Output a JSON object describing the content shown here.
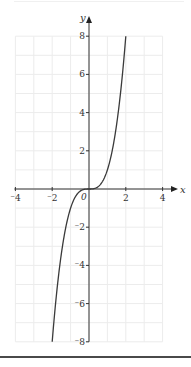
{
  "chart_data": {
    "type": "line",
    "title": "",
    "xlabel": "x",
    "ylabel": "y",
    "xlim": [
      -4,
      4
    ],
    "ylim": [
      -8,
      8
    ],
    "grid": true,
    "legend": null,
    "x_ticks": [
      -4,
      -2,
      0,
      2,
      4
    ],
    "x_tick_labels": [
      "⁻4",
      "⁻2",
      "0",
      "2",
      "4"
    ],
    "y_ticks": [
      -8,
      -6,
      -4,
      -2,
      2,
      4,
      6,
      8
    ],
    "y_tick_labels": [
      "⁻8",
      "⁻6",
      "⁻4",
      "⁻2",
      "2",
      "4",
      "6",
      "8"
    ],
    "origin_label": "0",
    "series": [
      {
        "name": "y = x^3",
        "x": [
          -2,
          -1.75,
          -1.5,
          -1.25,
          -1,
          -0.75,
          -0.5,
          -0.25,
          0,
          0.25,
          0.5,
          0.75,
          1,
          1.25,
          1.5,
          1.75,
          2
        ],
        "values": [
          -8,
          -5.36,
          -3.375,
          -1.95,
          -1,
          -0.42,
          -0.125,
          -0.016,
          0,
          0.016,
          0.125,
          0.42,
          1,
          1.95,
          3.375,
          5.36,
          8
        ]
      }
    ],
    "colors": {
      "curve": "#3a3a3a",
      "axis": "#333333",
      "grid": "#ececec"
    }
  }
}
